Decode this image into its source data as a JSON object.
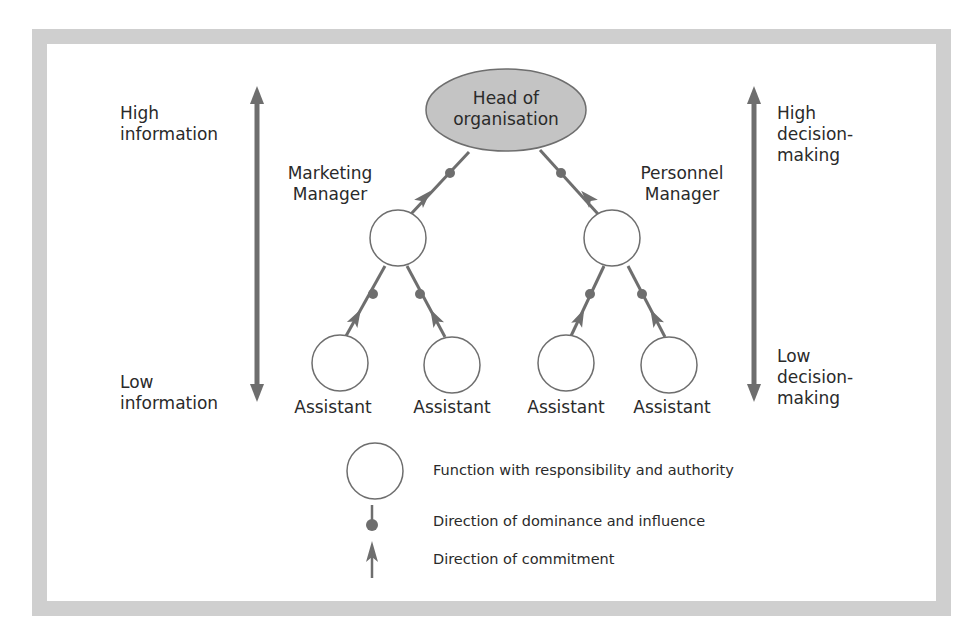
{
  "diagram": {
    "colors": {
      "frame": "#cfcfcf",
      "head_fill": "#c4c4c4",
      "line": "#6e6e6e",
      "text": "#2a2a2a"
    },
    "head": {
      "line1": "Head of",
      "line2": "organisation"
    },
    "managers": [
      {
        "line1": "Marketing",
        "line2": "Manager"
      },
      {
        "line1": "Personnel",
        "line2": "Manager"
      }
    ],
    "assistants": [
      "Assistant",
      "Assistant",
      "Assistant",
      "Assistant"
    ],
    "left_axis": {
      "top": {
        "line1": "High",
        "line2": "information"
      },
      "bottom": {
        "line1": "Low",
        "line2": "information"
      }
    },
    "right_axis": {
      "top": {
        "line1": "High",
        "line2": "decision-",
        "line3": "making"
      },
      "bottom": {
        "line1": "Low",
        "line2": "decision-",
        "line3": "making"
      }
    },
    "legend": [
      {
        "icon": "circle-icon",
        "label": "Function with responsibility and authority"
      },
      {
        "icon": "dot-dominance-icon",
        "label": "Direction of dominance and influence"
      },
      {
        "icon": "arrow-commitment-icon",
        "label": "Direction of commitment"
      }
    ]
  }
}
